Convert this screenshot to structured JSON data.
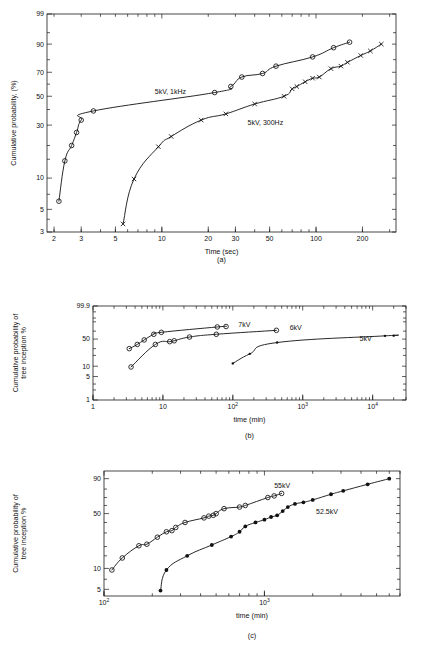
{
  "figure": {
    "panels": [
      "(a)",
      "(b)",
      "(c)"
    ]
  },
  "chart_data": [
    {
      "type": "scatter",
      "panel": "(a)",
      "title": "",
      "xlabel": "Time (sec)",
      "ylabel": "Cumulative probability, (%)",
      "xscale": "log",
      "yscale": "weibull-probability",
      "xlim": [
        1.8,
        330
      ],
      "ylim": [
        3,
        99
      ],
      "xticks": [
        "2",
        "3",
        "5",
        "10",
        "20",
        "30",
        "50",
        "100",
        "200"
      ],
      "xtick_values": [
        2,
        3,
        5,
        10,
        20,
        30,
        50,
        100,
        200
      ],
      "yticks": [
        "99",
        "90",
        "70",
        "50",
        "30",
        "10",
        "5",
        "3"
      ],
      "ytick_values": [
        99,
        90,
        70,
        50,
        30,
        10,
        5,
        3
      ],
      "grid": false,
      "legend_position": "inline-annotation",
      "series": [
        {
          "name": "5kV, 1kHz",
          "marker": "open-circle",
          "label_x": 9.0,
          "label_y": 52,
          "points": [
            {
              "x": 2.15,
              "y": 6.0
            },
            {
              "x": 2.35,
              "y": 14.5
            },
            {
              "x": 2.6,
              "y": 20.0
            },
            {
              "x": 2.8,
              "y": 26.0
            },
            {
              "x": 3.0,
              "y": 33.0
            },
            {
              "x": 3.6,
              "y": 39.0
            },
            {
              "x": 22.0,
              "y": 53.0
            },
            {
              "x": 28.0,
              "y": 58.0
            },
            {
              "x": 33.0,
              "y": 66.0
            },
            {
              "x": 45.0,
              "y": 69.0
            },
            {
              "x": 55.0,
              "y": 75.0
            },
            {
              "x": 95.0,
              "y": 82.0
            },
            {
              "x": 130.0,
              "y": 88.0
            },
            {
              "x": 165.0,
              "y": 91.0
            }
          ]
        },
        {
          "name": "5kV, 300Hz",
          "marker": "cross",
          "label_x": 36,
          "label_y": 30,
          "points": [
            {
              "x": 5.6,
              "y": 3.6
            },
            {
              "x": 6.6,
              "y": 9.8
            },
            {
              "x": 9.5,
              "y": 19.5
            },
            {
              "x": 11.5,
              "y": 24.0
            },
            {
              "x": 18.0,
              "y": 33.0
            },
            {
              "x": 26.0,
              "y": 37.0
            },
            {
              "x": 40.0,
              "y": 44.0
            },
            {
              "x": 62.0,
              "y": 50.0
            },
            {
              "x": 70.0,
              "y": 56.0
            },
            {
              "x": 75.0,
              "y": 58.0
            },
            {
              "x": 85.0,
              "y": 62.0
            },
            {
              "x": 95.0,
              "y": 65.0
            },
            {
              "x": 105.0,
              "y": 66.0
            },
            {
              "x": 125.0,
              "y": 73.0
            },
            {
              "x": 145.0,
              "y": 75.0
            },
            {
              "x": 160.0,
              "y": 78.0
            },
            {
              "x": 195.0,
              "y": 83.0
            },
            {
              "x": 225.0,
              "y": 86.0
            },
            {
              "x": 265.0,
              "y": 90.0
            }
          ]
        }
      ]
    },
    {
      "type": "scatter",
      "panel": "(b)",
      "title": "",
      "xlabel": "time (min)",
      "ylabel": "Cumulative probability of tree inception %",
      "xscale": "log",
      "yscale": "weibull-probability",
      "xlim": [
        1,
        30000
      ],
      "ylim": [
        1,
        99.9
      ],
      "xticks": [
        "1",
        "10",
        "10²",
        "10³",
        "10⁴"
      ],
      "xtick_values": [
        1,
        10,
        100,
        1000,
        10000
      ],
      "yticks": [
        "99.9",
        "50",
        "10",
        "5",
        "1"
      ],
      "ytick_values": [
        99.9,
        50,
        10,
        5,
        1
      ],
      "grid": false,
      "legend_position": "inline-annotation",
      "series": [
        {
          "name": "7kV",
          "marker": "open-circle",
          "label_x": 120,
          "label_y": 80,
          "points": [
            {
              "x": 3.3,
              "y": 30.0
            },
            {
              "x": 4.3,
              "y": 38.0
            },
            {
              "x": 5.4,
              "y": 48.0
            },
            {
              "x": 7.4,
              "y": 62.0
            },
            {
              "x": 9.5,
              "y": 67.0
            },
            {
              "x": 60.0,
              "y": 80.0
            },
            {
              "x": 80.0,
              "y": 81.0
            }
          ]
        },
        {
          "name": "6kV",
          "marker": "open-circle",
          "label_x": 650,
          "label_y": 74,
          "points": [
            {
              "x": 3.5,
              "y": 9.5
            },
            {
              "x": 7.8,
              "y": 38.0
            },
            {
              "x": 12.5,
              "y": 44.0
            },
            {
              "x": 14.5,
              "y": 46.0
            },
            {
              "x": 24.0,
              "y": 55.0
            },
            {
              "x": 58.0,
              "y": 62.0
            },
            {
              "x": 420.0,
              "y": 72.0
            }
          ]
        },
        {
          "name": "5kV",
          "marker": "filled-small",
          "label_x": 6500,
          "label_y": 45,
          "points": [
            {
              "x": 100.0,
              "y": 12.0
            },
            {
              "x": 175.0,
              "y": 22.0
            },
            {
              "x": 430.0,
              "y": 42.0
            },
            {
              "x": 15000.0,
              "y": 58.0
            },
            {
              "x": 20000.0,
              "y": 58.5
            }
          ]
        }
      ]
    },
    {
      "type": "scatter",
      "panel": "(c)",
      "title": "",
      "xlabel": "time (min)",
      "ylabel": "Cumulative probability of tree inception %",
      "xscale": "log",
      "yscale": "weibull-probability",
      "xlim": [
        100,
        7000
      ],
      "ylim": [
        4,
        95
      ],
      "xticks": [
        "10²",
        "10³"
      ],
      "xtick_values": [
        100,
        1000
      ],
      "yticks": [
        "90",
        "50",
        "10",
        "5"
      ],
      "ytick_values": [
        90,
        50,
        10,
        5
      ],
      "grid": false,
      "legend_position": "inline-annotation",
      "series": [
        {
          "name": "55kV",
          "marker": "open-circle",
          "label_x": 1150,
          "label_y": 81,
          "points": [
            {
              "x": 112,
              "y": 9.5
            },
            {
              "x": 130,
              "y": 14.0
            },
            {
              "x": 165,
              "y": 20.5
            },
            {
              "x": 185,
              "y": 21.5
            },
            {
              "x": 215,
              "y": 26.5
            },
            {
              "x": 245,
              "y": 31.0
            },
            {
              "x": 265,
              "y": 32.0
            },
            {
              "x": 280,
              "y": 35.0
            },
            {
              "x": 320,
              "y": 40.0
            },
            {
              "x": 420,
              "y": 45.0
            },
            {
              "x": 450,
              "y": 47.0
            },
            {
              "x": 480,
              "y": 48.0
            },
            {
              "x": 500,
              "y": 50.0
            },
            {
              "x": 560,
              "y": 56.0
            },
            {
              "x": 700,
              "y": 58.0
            },
            {
              "x": 760,
              "y": 60.0
            },
            {
              "x": 1050,
              "y": 70.0
            },
            {
              "x": 1150,
              "y": 72.0
            },
            {
              "x": 1280,
              "y": 75.0
            }
          ]
        },
        {
          "name": "52.5kV",
          "marker": "filled-circle",
          "label_x": 2100,
          "label_y": 49,
          "points": [
            {
              "x": 225,
              "y": 4.8
            },
            {
              "x": 245,
              "y": 9.5
            },
            {
              "x": 330,
              "y": 15.0
            },
            {
              "x": 470,
              "y": 21.0
            },
            {
              "x": 620,
              "y": 27.0
            },
            {
              "x": 700,
              "y": 31.0
            },
            {
              "x": 760,
              "y": 36.0
            },
            {
              "x": 880,
              "y": 40.0
            },
            {
              "x": 1000,
              "y": 43.0
            },
            {
              "x": 1100,
              "y": 46.0
            },
            {
              "x": 1200,
              "y": 48.0
            },
            {
              "x": 1300,
              "y": 53.0
            },
            {
              "x": 1400,
              "y": 58.0
            },
            {
              "x": 1550,
              "y": 62.0
            },
            {
              "x": 1750,
              "y": 64.0
            },
            {
              "x": 2000,
              "y": 67.0
            },
            {
              "x": 2600,
              "y": 74.0
            },
            {
              "x": 3100,
              "y": 78.0
            },
            {
              "x": 4400,
              "y": 85.0
            },
            {
              "x": 6000,
              "y": 90.0
            }
          ]
        }
      ]
    }
  ]
}
